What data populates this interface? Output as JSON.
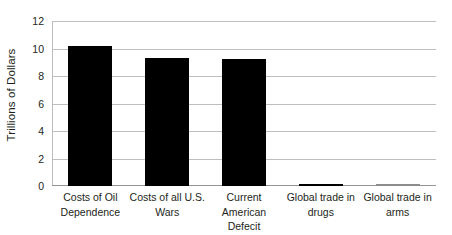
{
  "chart_data": {
    "type": "bar",
    "title": "",
    "subtitle": "",
    "xlabel": "",
    "ylabel": "Trillions of Dollars",
    "ylim": [
      0,
      12
    ],
    "yticks": [
      "0",
      "2",
      "4",
      "6",
      "8",
      "10",
      "12"
    ],
    "ytick_values": [
      0,
      2,
      4,
      6,
      8,
      10,
      12
    ],
    "grid": true,
    "legend": false,
    "orientation": "vertical",
    "bar_color": "#000000",
    "gridline_color": "#bcbec0",
    "background_color": "#ffffff",
    "categories": [
      "Costs of Oil Dependence",
      "Costs of all U.S. Wars",
      "Current American Defecit",
      "Global trade in drugs",
      "Global trade in arms"
    ],
    "category_lines": [
      [
        "Costs of Oil",
        "Dependence"
      ],
      [
        "Costs of all U.S.",
        "Wars"
      ],
      [
        "Current",
        "American Defecit"
      ],
      [
        "Global trade in",
        "drugs"
      ],
      [
        "Global trade in",
        "arms"
      ]
    ],
    "values": [
      10.2,
      9.3,
      9.25,
      0.1,
      0.01
    ]
  },
  "axes": {
    "y_title": "Trillions of Dollars"
  }
}
